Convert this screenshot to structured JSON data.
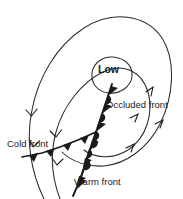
{
  "diagram": {
    "kind": "mid-latitude-cyclone-weather-map",
    "labels": {
      "low": "Low",
      "occluded_front": "Occluded front",
      "cold_front": "Cold front",
      "warm_front": "Warm front"
    },
    "colors": {
      "ink": "#1a1a1a",
      "isobar": "#2b2b2b",
      "background": "#ffffff"
    },
    "isobars": {
      "count": 3,
      "flow_direction": "counterclockwise",
      "marker": "chevron-arrow"
    },
    "fronts": [
      {
        "name": "occluded",
        "symbol": "alternating-triangles-and-semicircles",
        "label": "Occluded front"
      },
      {
        "name": "cold",
        "symbol": "filled-triangles",
        "label": "Cold front"
      },
      {
        "name": "warm",
        "symbol": "filled-semicircles",
        "label": "Warm front"
      }
    ]
  }
}
